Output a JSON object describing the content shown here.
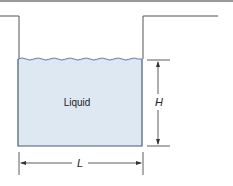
{
  "diagram": {
    "liquid_label": "Liquid",
    "height_label": "H",
    "length_label": "L"
  },
  "colors": {
    "liquid_fill": "#dde8f3",
    "liquid_border": "#4a5a7a",
    "surface_wave": "#5a6e9a",
    "wall": "#555555",
    "top_rule": "#9a9a9a",
    "dimension": "#333333"
  }
}
